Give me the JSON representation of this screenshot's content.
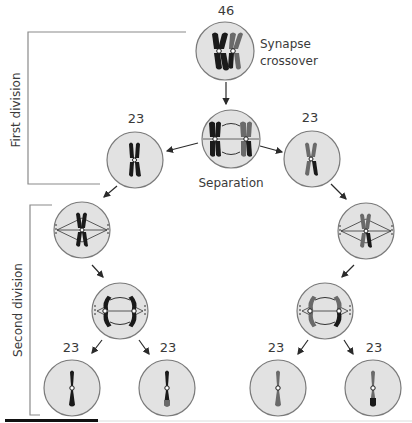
{
  "diagram": {
    "top_cell": {
      "count": "46",
      "caption_line1": "Synapse",
      "caption_line2": "crossover"
    },
    "separation_cell": {
      "caption": "Separation"
    },
    "first_division_left": {
      "count": "23"
    },
    "first_division_right": {
      "count": "23"
    },
    "gametes": [
      {
        "count": "23"
      },
      {
        "count": "23"
      },
      {
        "count": "23"
      },
      {
        "count": "23"
      }
    ],
    "brackets": {
      "first": "First division",
      "second": "Second division"
    },
    "colors": {
      "cell_fill": "#e2e2e2",
      "cell_stroke": "#7a7a7a",
      "chromosome_dark": "#1a1a1a",
      "chromosome_gray": "#6a6a6a",
      "bracket": "#8a8a8a",
      "text": "#3a3a3a"
    }
  }
}
